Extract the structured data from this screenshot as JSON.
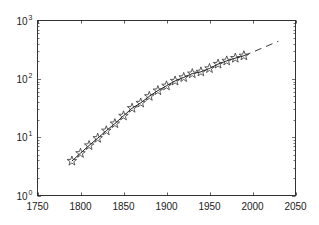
{
  "chart_data": {
    "type": "line",
    "title": "",
    "xlabel": "",
    "ylabel": "",
    "xscale": "linear",
    "yscale": "log",
    "xlim": [
      1750,
      2050
    ],
    "ylim": [
      1,
      1000
    ],
    "grid": false,
    "legend": null,
    "x_ticks": [
      1750,
      1800,
      1850,
      1900,
      1950,
      2000,
      2050
    ],
    "y_ticks": [
      {
        "base": "10",
        "exp": "0",
        "value": 1
      },
      {
        "base": "10",
        "exp": "1",
        "value": 10
      },
      {
        "base": "10",
        "exp": "2",
        "value": 100
      },
      {
        "base": "10",
        "exp": "3",
        "value": 1000
      }
    ],
    "series": [
      {
        "name": "data",
        "style": "solid line with pentagram markers",
        "color": "#222222",
        "x": [
          1790,
          1800,
          1810,
          1820,
          1830,
          1840,
          1850,
          1860,
          1870,
          1880,
          1890,
          1900,
          1910,
          1920,
          1930,
          1940,
          1950,
          1960,
          1970,
          1980,
          1990
        ],
        "values": [
          3.9,
          5.3,
          7.2,
          9.6,
          12.9,
          17.1,
          23.2,
          31.4,
          38.6,
          50.2,
          62.9,
          76.0,
          92.0,
          105.7,
          122.8,
          131.7,
          150.7,
          179.3,
          203.2,
          226.5,
          248.7
        ]
      },
      {
        "name": "extrapolation",
        "style": "dashed line",
        "color": "#222222",
        "x": [
          1990,
          2030
        ],
        "values": [
          248.7,
          440
        ]
      }
    ]
  }
}
